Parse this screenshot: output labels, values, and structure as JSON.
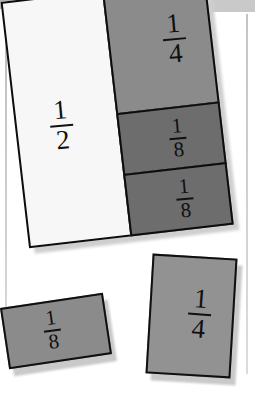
{
  "scene": {
    "title": "Fraction pieces",
    "background_color": "#ffffff",
    "surface_band_color": "#b2b2b2",
    "guide_line_color": "#c6c6c6",
    "outline_color": "#101010",
    "shadow_color": "#c9c9c9"
  },
  "composite_bar": {
    "name": "fraction-bar-composite",
    "cells": [
      {
        "label_numerator": "1",
        "label_denominator": "2",
        "fill_color": "#f7f7f7",
        "fraction": "1/2"
      },
      {
        "label_numerator": "1",
        "label_denominator": "4",
        "fill_color": "#8b8b8b",
        "fraction": "1/4"
      },
      {
        "label_numerator": "1",
        "label_denominator": "8",
        "fill_color": "#6d6d6d",
        "fraction": "1/8"
      },
      {
        "label_numerator": "1",
        "label_denominator": "8",
        "fill_color": "#6d6d6d",
        "fraction": "1/8"
      }
    ]
  },
  "loose_pieces": [
    {
      "name": "loose-piece-eighth",
      "label_numerator": "1",
      "label_denominator": "8",
      "fill_color": "#8b8b8b",
      "fraction": "1/8"
    },
    {
      "name": "loose-piece-quarter",
      "label_numerator": "1",
      "label_denominator": "4",
      "fill_color": "#929292",
      "fraction": "1/4"
    }
  ]
}
